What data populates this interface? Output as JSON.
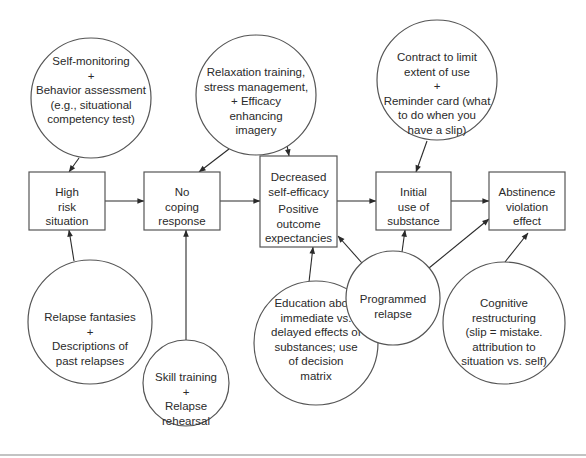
{
  "colors": {
    "stroke": "#555555",
    "text": "#2a2a2a",
    "background": "#ffffff"
  },
  "boxes": [
    {
      "id": "high-risk",
      "x": 29,
      "y": 172,
      "w": 76,
      "h": 58,
      "lines": [
        "High",
        "risk",
        "situation"
      ],
      "ty": 186
    },
    {
      "id": "no-coping",
      "x": 144,
      "y": 172,
      "w": 76,
      "h": 58,
      "lines": [
        "No",
        "coping",
        "response"
      ],
      "ty": 186
    },
    {
      "id": "decreased-efficacy",
      "x": 260,
      "y": 156,
      "w": 77,
      "h": 91,
      "lines": [
        "Decreased",
        "self-efficacy",
        "Positive",
        "outcome",
        "expectancies"
      ],
      "ty": 171,
      "gaps": [
        0,
        0,
        3,
        0,
        0
      ]
    },
    {
      "id": "initial-use",
      "x": 376,
      "y": 172,
      "w": 75,
      "h": 58,
      "lines": [
        "Initial",
        "use of",
        "substance"
      ],
      "ty": 186
    },
    {
      "id": "abstinence-violation",
      "x": 489,
      "y": 172,
      "w": 76,
      "h": 58,
      "lines": [
        "Abstinence",
        "violation",
        "effect"
      ],
      "ty": 186
    }
  ],
  "circles": [
    {
      "id": "self-monitoring",
      "cx": 91,
      "cy": 98,
      "r": 60,
      "lines": [
        "Self-monitoring",
        "+",
        "Behavior assessment",
        "(e.g., situational",
        "competency test)"
      ],
      "ty": 55
    },
    {
      "id": "relaxation-training",
      "cx": 256,
      "cy": 95,
      "r": 60,
      "lines": [
        "Relaxation training,",
        "stress management,",
        "+ Efficacy",
        "enhancing",
        "imagery"
      ],
      "ty": 66
    },
    {
      "id": "contract-reminder",
      "cx": 437,
      "cy": 80,
      "r": 60,
      "lines": [
        "Contract to limit",
        "extent of use",
        "+",
        "Reminder card (what",
        "to do when you",
        "have a slip)"
      ],
      "ty": 51
    },
    {
      "id": "relapse-fantasies",
      "cx": 90,
      "cy": 322,
      "r": 62,
      "lines": [
        "Relapse fantasies",
        "+",
        "Descriptions of",
        "past relapses"
      ],
      "ty": 311
    },
    {
      "id": "skill-training",
      "cx": 186,
      "cy": 383,
      "r": 43,
      "lines": [
        "Skill training",
        "+",
        "Relapse",
        "rehearsal"
      ],
      "ty": 371
    },
    {
      "id": "education",
      "cx": 316,
      "cy": 343,
      "r": 62,
      "lines": [
        "Education about",
        "immediate vs.",
        "delayed effects of",
        "substances; use",
        "of decision",
        "matrix"
      ],
      "ty": 297
    },
    {
      "id": "programmed-relapse",
      "cx": 393,
      "cy": 298,
      "r": 47,
      "lines": [
        "Programmed",
        "relapse"
      ],
      "ty": 293
    },
    {
      "id": "cognitive-restructuring",
      "cx": 504,
      "cy": 323,
      "r": 61,
      "lines": [
        "Cognitive",
        "restructuring",
        "(slip = mistake.",
        "attribution to",
        "situation vs. self)"
      ],
      "ty": 297
    }
  ],
  "arrows": [
    {
      "from": "high-risk",
      "to": "no-coping",
      "x1": 105,
      "y1": 201,
      "x2": 144,
      "y2": 201
    },
    {
      "from": "no-coping",
      "to": "decreased-efficacy",
      "x1": 220,
      "y1": 201,
      "x2": 260,
      "y2": 201
    },
    {
      "from": "decreased-efficacy",
      "to": "initial-use",
      "x1": 337,
      "y1": 201,
      "x2": 376,
      "y2": 201
    },
    {
      "from": "initial-use",
      "to": "abstinence-violation",
      "x1": 451,
      "y1": 201,
      "x2": 489,
      "y2": 201
    },
    {
      "from": "self-monitoring",
      "to": "high-risk",
      "x1": 79,
      "y1": 158,
      "x2": 69,
      "y2": 172
    },
    {
      "from": "relaxation-training",
      "to": "no-coping",
      "x1": 229,
      "y1": 149,
      "x2": 199,
      "y2": 172
    },
    {
      "from": "relaxation-training",
      "to": "decreased-efficacy",
      "x1": 286,
      "y1": 140,
      "x2": 289,
      "y2": 156
    },
    {
      "from": "contract-reminder",
      "to": "initial-use",
      "x1": 427,
      "y1": 141,
      "x2": 416,
      "y2": 172
    },
    {
      "from": "relapse-fantasies",
      "to": "high-risk",
      "x1": 74,
      "y1": 261,
      "x2": 69,
      "y2": 230
    },
    {
      "from": "skill-training",
      "to": "no-coping",
      "x1": 186,
      "y1": 340,
      "x2": 186,
      "y2": 230
    },
    {
      "from": "education",
      "to": "decreased-efficacy",
      "x1": 309,
      "y1": 282,
      "x2": 313,
      "y2": 247
    },
    {
      "from": "programmed-relapse",
      "to": "decreased-efficacy",
      "x1": 362,
      "y1": 263,
      "x2": 338,
      "y2": 236
    },
    {
      "from": "programmed-relapse",
      "to": "initial-use",
      "x1": 402,
      "y1": 252,
      "x2": 405,
      "y2": 230
    },
    {
      "from": "programmed-relapse",
      "to": "abstinence-violation",
      "x1": 429,
      "y1": 268,
      "x2": 489,
      "y2": 219
    },
    {
      "from": "cognitive-restructuring",
      "to": "abstinence-violation",
      "x1": 505,
      "y1": 262,
      "x2": 528,
      "y2": 233
    }
  ],
  "footer_rule": {
    "x1": 0,
    "x2": 586,
    "y": 455
  }
}
